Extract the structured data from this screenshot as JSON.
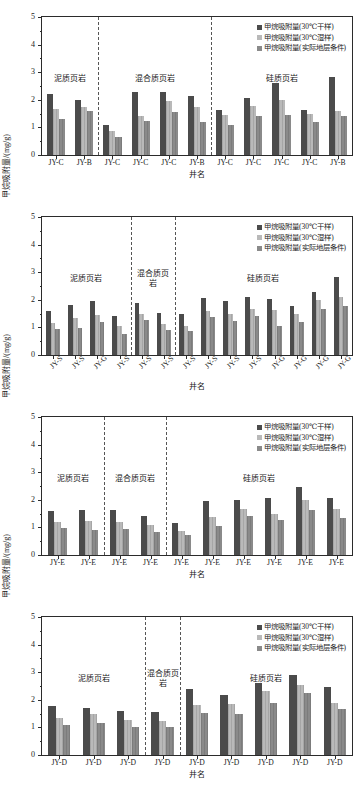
{
  "legend": {
    "items": [
      {
        "label": "甲烷吸附量(30℃干样)",
        "color": "#4b4b4b",
        "key": "dry30"
      },
      {
        "label": "甲烷吸附量(30℃湿样)",
        "color": "#b9b9b9",
        "key": "wet30"
      },
      {
        "label": "甲烷吸附量(实际地层条件)",
        "color": "#8a8a8a",
        "key": "insitu"
      }
    ]
  },
  "axis": {
    "ylabel": "甲烷吸附量/(mg/g)",
    "xlabel": "井名",
    "yticks": [
      "0",
      "1",
      "2",
      "3",
      "4",
      "5"
    ],
    "ymin": 0,
    "ymax": 5
  },
  "lithology": {
    "argillaceous": "泥质页岩",
    "mixed": "混合质页岩",
    "mixed_line1": "混合质",
    "mixed_line2": "页岩",
    "siliceous": "硅质页岩"
  },
  "chart_data": [
    {
      "id": "panel-0",
      "type": "bar",
      "title": "",
      "xlabel": "井名",
      "ylabel": "甲烷吸附量/(mg/g)",
      "ylim": [
        0,
        5
      ],
      "yticks": [
        0,
        1,
        2,
        3,
        4,
        5
      ],
      "grid": false,
      "legend_position": "top-right",
      "label_rotation": 0,
      "categories": [
        "JY-C",
        "JY-B",
        "JY-C",
        "JY-C",
        "JY-C",
        "JY-B",
        "JY-C",
        "JY-C",
        "JY-C",
        "JY-C",
        "JY-B"
      ],
      "series": [
        {
          "name": "甲烷吸附量(30℃干样)",
          "values": [
            2.2,
            1.98,
            1.1,
            2.27,
            2.27,
            2.13,
            1.64,
            2.08,
            2.61,
            1.62,
            2.84
          ]
        },
        {
          "name": "甲烷吸附量(30℃湿样)",
          "values": [
            1.67,
            1.73,
            0.88,
            1.43,
            1.97,
            1.75,
            1.44,
            1.77,
            1.98,
            1.5,
            1.6
          ]
        },
        {
          "name": "甲烷吸附量(实际地层条件)",
          "values": [
            1.3,
            1.6,
            0.65,
            1.22,
            1.56,
            1.18,
            1.09,
            1.42,
            1.45,
            1.2,
            1.4
          ]
        }
      ],
      "bands": [
        {
          "label": "泥质页岩",
          "start": 0,
          "end": 2,
          "lines": 1
        },
        {
          "label": "混合质页岩",
          "start": 2,
          "end": 6,
          "lines": 1
        },
        {
          "label": "硅质页岩",
          "start": 6,
          "end": 11,
          "lines": 1
        }
      ],
      "dividers": [
        2,
        6
      ]
    },
    {
      "id": "panel-1",
      "type": "bar",
      "title": "",
      "xlabel": "井名",
      "ylabel": "甲烷吸附量/(mg/g)",
      "ylim": [
        0,
        5
      ],
      "yticks": [
        0,
        1,
        2,
        3,
        4,
        5
      ],
      "grid": false,
      "legend_position": "top-right",
      "label_rotation": -45,
      "categories": [
        "JY-S",
        "JY-S",
        "JY-G",
        "JY-S",
        "JY-S",
        "JY-S",
        "JY-S",
        "JY-S",
        "JY-S",
        "JY-S",
        "JY-G",
        "JY-G",
        "JY-G",
        "JY-G"
      ],
      "series": [
        {
          "name": "甲烷吸附量(30℃干样)",
          "values": [
            1.58,
            1.8,
            1.94,
            1.42,
            1.9,
            1.54,
            1.47,
            2.05,
            1.97,
            2.11,
            2.02,
            1.77,
            2.28,
            2.81
          ]
        },
        {
          "name": "甲烷吸附量(30℃湿样)",
          "values": [
            1.16,
            1.35,
            1.46,
            1.04,
            1.47,
            1.13,
            1.06,
            1.59,
            1.49,
            1.67,
            1.62,
            1.49,
            1.98,
            2.1
          ]
        },
        {
          "name": "甲烷吸附量(实际地层条件)",
          "values": [
            0.94,
            0.99,
            1.18,
            0.77,
            1.28,
            0.92,
            0.88,
            1.37,
            1.23,
            1.43,
            1.04,
            1.2,
            1.65,
            1.79
          ]
        }
      ],
      "bands": [
        {
          "label": "泥质页岩",
          "start": 0,
          "end": 4,
          "lines": 1
        },
        {
          "label": "混合质页岩",
          "start": 4,
          "end": 6,
          "lines": 2
        },
        {
          "label": "硅质页岩",
          "start": 6,
          "end": 14,
          "lines": 1
        }
      ],
      "dividers": [
        4,
        6
      ]
    },
    {
      "id": "panel-2",
      "type": "bar",
      "title": "",
      "xlabel": "井名",
      "ylabel": "甲烷吸附量/(mg/g)",
      "ylim": [
        0,
        5
      ],
      "yticks": [
        0,
        1,
        2,
        3,
        4,
        5
      ],
      "grid": false,
      "legend_position": "top-right",
      "label_rotation": 0,
      "categories": [
        "JY-E",
        "JY-E",
        "JY-E",
        "JY-E",
        "JY-E",
        "JY-E",
        "JY-E",
        "JY-E",
        "JY-E",
        "JY-E"
      ],
      "series": [
        {
          "name": "甲烷吸附量(30℃干样)",
          "values": [
            1.6,
            1.62,
            1.62,
            1.4,
            1.17,
            1.94,
            1.99,
            2.06,
            2.48,
            2.05
          ]
        },
        {
          "name": "甲烷吸附量(30℃湿样)",
          "values": [
            1.2,
            1.22,
            1.18,
            1.08,
            0.88,
            1.37,
            1.68,
            1.5,
            2.0,
            1.65
          ]
        },
        {
          "name": "甲烷吸附量(实际地层条件)",
          "values": [
            0.98,
            0.92,
            0.93,
            0.85,
            0.72,
            1.05,
            1.4,
            1.28,
            1.64,
            1.35
          ]
        }
      ],
      "bands": [
        {
          "label": "泥质页岩",
          "start": 0,
          "end": 2,
          "lines": 1
        },
        {
          "label": "混合质页岩",
          "start": 2,
          "end": 4,
          "lines": 1
        },
        {
          "label": "硅质页岩",
          "start": 4,
          "end": 10,
          "lines": 1
        }
      ],
      "dividers": [
        2,
        4
      ]
    },
    {
      "id": "panel-3",
      "type": "bar",
      "title": "",
      "xlabel": "井名",
      "ylabel": "甲烷吸附量/(mg/g)",
      "ylim": [
        0,
        5
      ],
      "yticks": [
        0,
        1,
        2,
        3,
        4,
        5
      ],
      "grid": false,
      "legend_position": "top-right",
      "label_rotation": 0,
      "categories": [
        "JY-D",
        "JY-D",
        "JY-D",
        "JY-D",
        "JY-D",
        "JY-D",
        "JY-D",
        "JY-D",
        "JY-D"
      ],
      "series": [
        {
          "name": "甲烷吸附量(30℃干样)",
          "values": [
            1.77,
            1.72,
            1.58,
            1.56,
            2.4,
            2.17,
            2.6,
            2.91,
            2.45
          ]
        },
        {
          "name": "甲烷吸附量(30℃湿样)",
          "values": [
            1.33,
            1.5,
            1.28,
            1.24,
            1.81,
            1.85,
            2.31,
            2.53,
            1.9
          ]
        },
        {
          "name": "甲烷吸附量(实际地层条件)",
          "values": [
            1.1,
            1.17,
            1.0,
            1.03,
            1.52,
            1.5,
            1.89,
            2.25,
            1.66
          ]
        }
      ],
      "bands": [
        {
          "label": "泥质页岩",
          "start": 0,
          "end": 3,
          "lines": 1
        },
        {
          "label": "混合质页岩",
          "start": 3,
          "end": 4,
          "lines": 2
        },
        {
          "label": "硅质页岩",
          "start": 4,
          "end": 9,
          "lines": 1
        }
      ],
      "dividers": [
        3,
        4
      ]
    }
  ]
}
